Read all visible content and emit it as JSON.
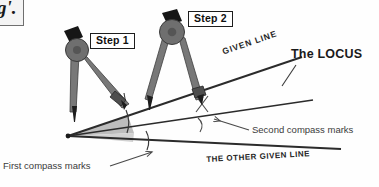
{
  "figure": {
    "background_color": "#fefefe",
    "line_color": "#2b2b2b",
    "compass_body_color": "#7a7a7a",
    "compass_dark_color": "#4a4a4a",
    "compass_handle_color": "#141414",
    "wedge_color": "#b8b8b8"
  },
  "corner_box": {
    "text_fragment": "g'.",
    "name": "clipped-text-box"
  },
  "steps": [
    {
      "id": "step1",
      "label": "Step 1"
    },
    {
      "id": "step2",
      "label": "Step 2"
    }
  ],
  "lines": [
    {
      "id": "given-line",
      "label": "GIVEN LINE"
    },
    {
      "id": "other-given-line",
      "label": "THE OTHER GIVEN LINE"
    },
    {
      "id": "locus-line",
      "label": "The LOCUS"
    }
  ],
  "callouts": [
    {
      "id": "locus",
      "label": "The LOCUS"
    },
    {
      "id": "second-marks",
      "label": "Second compass marks"
    },
    {
      "id": "first-marks",
      "label": "First compass marks"
    }
  ],
  "geometry": {
    "vertex": {
      "x": 68,
      "y": 136
    },
    "given_line_end": {
      "x": 300,
      "y": 58
    },
    "locus_line_end": {
      "x": 312,
      "y": 100
    },
    "other_given_line_end": {
      "x": 340,
      "y": 150
    }
  }
}
